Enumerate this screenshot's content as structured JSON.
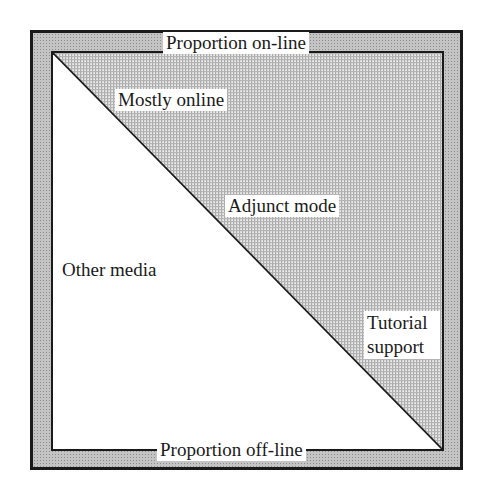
{
  "diagram": {
    "top_axis_label": "Proportion on-line",
    "bottom_axis_label": "Proportion off-line",
    "regions": [
      {
        "id": "mostly-online",
        "label": "Mostly online"
      },
      {
        "id": "adjunct-mode",
        "label": "Adjunct mode"
      },
      {
        "id": "other-media",
        "label": "Other media"
      },
      {
        "id": "tutorial-support",
        "label_line1": "Tutorial",
        "label_line2": "support"
      }
    ],
    "colors": {
      "border": "#1a1a1a",
      "frame_fill": "#c4c4c4",
      "online_fill": "#d9d9d9",
      "offline_fill": "#ffffff"
    }
  }
}
